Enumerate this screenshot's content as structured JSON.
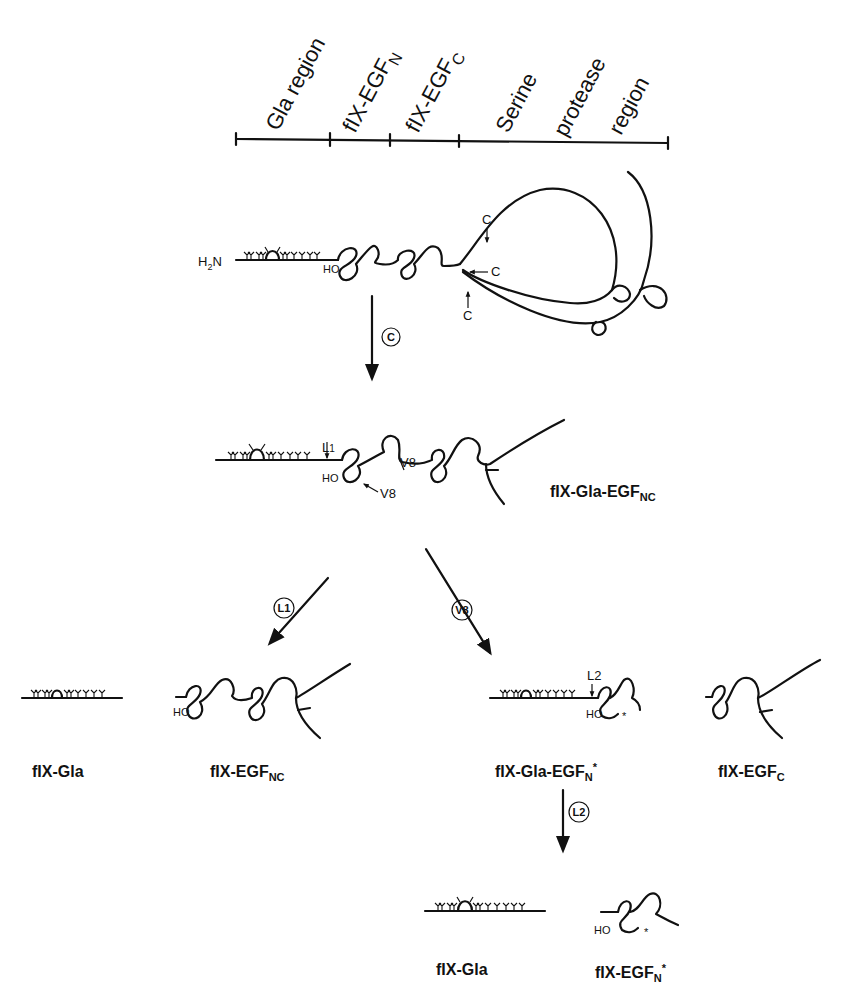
{
  "domain_regions": {
    "labels": [
      {
        "text": "Gla region",
        "sub": ""
      },
      {
        "text": "fIX-EGF",
        "sub": "N"
      },
      {
        "text": "fIX-EGF",
        "sub": "C"
      },
      {
        "text": "Serine",
        "sub": ""
      },
      {
        "text": "protease",
        "sub": ""
      },
      {
        "text": "region",
        "sub": ""
      }
    ]
  },
  "intact": {
    "n_terminus": "H",
    "n_sub": "2",
    "n_suffix": "N",
    "hydroxyl": "HO",
    "cleavage_sites": [
      "C",
      "C",
      "C"
    ]
  },
  "steps": {
    "c": "C",
    "l1": "L1",
    "v8": "V8",
    "l2": "L2"
  },
  "gla_egf_nc": {
    "site_l1": "L",
    "site_l1_sub": "1",
    "site_v8_a": "V8",
    "site_v8_b": "V8",
    "hydroxyl": "HO",
    "name": "fIX-Gla-EGF",
    "name_sub": "NC"
  },
  "products_l1": [
    {
      "name": "fIX-Gla",
      "sub": ""
    },
    {
      "name": "fIX-EGF",
      "sub": "NC",
      "hydroxyl": "HO"
    }
  ],
  "products_v8": [
    {
      "name": "fIX-Gla-EGF",
      "sub": "N",
      "sup": "*",
      "site": "L2",
      "hydroxyl": "HO",
      "mark": "*"
    },
    {
      "name": "fIX-EGF",
      "sub": "C"
    }
  ],
  "products_l2": [
    {
      "name": "fIX-Gla",
      "sub": ""
    },
    {
      "name": "fIX-EGF",
      "sub": "N",
      "sup": "*",
      "hydroxyl": "HO",
      "mark": "*"
    }
  ]
}
